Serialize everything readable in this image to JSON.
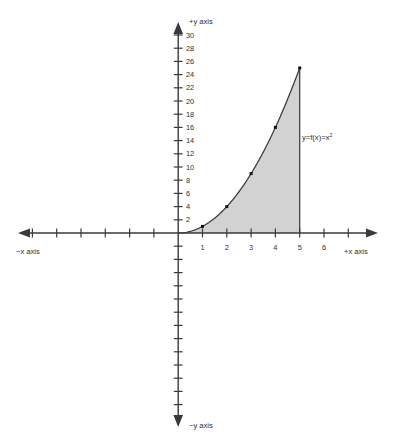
{
  "chart_data": {
    "type": "line",
    "title": "",
    "subtitle": "",
    "xlabel": "+x axis",
    "ylabel": "+y axis",
    "xlabel_negative": "−x axis",
    "ylabel_negative": "−y axis",
    "curve_label": "y=f(x)=x",
    "curve_label_exponent": "2",
    "function": "y = f(x) = x^2",
    "grid": false,
    "legend": "none",
    "annotations": [
      "y=f(x)=x²"
    ],
    "x": [
      1,
      2,
      3,
      4,
      5
    ],
    "values": [
      1,
      4,
      9,
      16,
      25
    ],
    "series": [
      {
        "name": "y=f(x)=x²",
        "x": [
          1,
          2,
          3,
          4,
          5
        ],
        "values": [
          1,
          4,
          9,
          16,
          25
        ]
      }
    ],
    "marked_points": [
      {
        "x": 1,
        "y": 1
      },
      {
        "x": 2,
        "y": 4
      },
      {
        "x": 3,
        "y": 9
      },
      {
        "x": 4,
        "y": 16
      },
      {
        "x": 5,
        "y": 25
      }
    ],
    "shaded_region": {
      "description": "area under curve",
      "x_from": 0,
      "x_to": 5,
      "fill_color": "#d2d2d2"
    },
    "xlim": [
      -7,
      7
    ],
    "ylim": [
      -17,
      32
    ],
    "x_tick_labels": [
      "1",
      "2",
      "3",
      "4",
      "5",
      "6"
    ],
    "x_tick_values": [
      1,
      2,
      3,
      4,
      5,
      6
    ],
    "y_tick_labels": [
      "2",
      "4",
      "6",
      "8",
      "10",
      "12",
      "14",
      "16",
      "18",
      "20",
      "22",
      "24",
      "26",
      "28",
      "30"
    ],
    "y_tick_values": [
      2,
      4,
      6,
      8,
      10,
      12,
      14,
      16,
      18,
      20,
      22,
      24,
      26,
      28,
      30
    ],
    "colors": {
      "axis": "#3a3a3a",
      "curve": "#3a3a3a",
      "point": "#111111",
      "fill": "#d2d2d2",
      "background": "#ffffff"
    }
  }
}
